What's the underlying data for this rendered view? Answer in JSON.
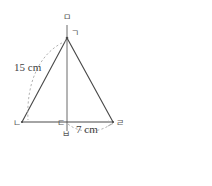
{
  "figure": {
    "type": "isosceles-triangle-with-altitude",
    "vertex_labels": {
      "top_marker": "ㅁ",
      "apex": "ㄱ",
      "bottom_left": "ㄴ",
      "base_foot": "ㄷ",
      "bottom_marker": "ㅂ",
      "bottom_right": "ㄹ"
    },
    "measurements": {
      "slant_side": "15 cm",
      "base_half": "7 cm"
    },
    "geometry": {
      "apex": [
        67,
        38
      ],
      "bottom_left": [
        22,
        122
      ],
      "bottom_right": [
        113,
        122
      ],
      "base_foot": [
        67,
        122
      ],
      "vertical_top": [
        67,
        25
      ],
      "vertical_bottom": [
        67,
        131
      ]
    },
    "colors": {
      "stroke": "#4a4a4a",
      "dashed": "#9a9a9a",
      "text": "#4a4a4a"
    }
  },
  "answer": {
    "open_paren": "(",
    "close_paren": ")",
    "value": ""
  }
}
